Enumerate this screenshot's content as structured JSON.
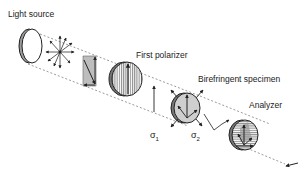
{
  "diagram": {
    "labels": {
      "light_source": "Light source",
      "first_polarizer": "First polarizer",
      "specimen": "Birefringent specimen",
      "analyzer": "Analyzer",
      "sigma1": "σ",
      "sigma1_sub": "1",
      "sigma2": "σ",
      "sigma2_sub": "2"
    },
    "components": [
      {
        "id": "light-source",
        "shape": "ring-disc"
      },
      {
        "id": "unpolarized-rays",
        "shape": "star-arrows"
      },
      {
        "id": "wave-panel",
        "shape": "gray-plate"
      },
      {
        "id": "first-polarizer",
        "shape": "vertically-hatched-disc"
      },
      {
        "id": "polarized-wave",
        "shape": "vertical-arrow"
      },
      {
        "id": "birefringent-specimen",
        "shape": "gray-disc-with-stress-arrows"
      },
      {
        "id": "analyzer",
        "shape": "horizontally-hatched-disc"
      },
      {
        "id": "viewer-arrow",
        "shape": "arrow"
      }
    ],
    "colors": {
      "line": "#222222",
      "fill": "#bdbdbd",
      "dash": "#555555"
    }
  }
}
